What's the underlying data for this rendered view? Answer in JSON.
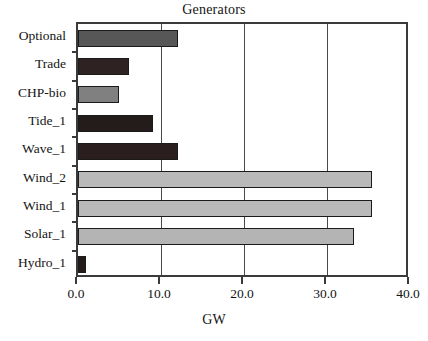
{
  "chart_data": {
    "type": "bar",
    "orientation": "horizontal",
    "title": "Generators",
    "xlabel": "GW",
    "ylabel": "",
    "xlim": [
      0.0,
      40.0
    ],
    "xticks": [
      "0.0",
      "10.0",
      "20.0",
      "30.0",
      "40.0"
    ],
    "xtick_values": [
      0.0,
      10.0,
      20.0,
      30.0,
      40.0
    ],
    "grid": "vertical gridlines at each x tick",
    "legend": "none",
    "categories": [
      "Optional",
      "Trade",
      "CHP-bio",
      "Tide_1",
      "Wave_1",
      "Wind_2",
      "Wind_1",
      "Solar_1",
      "Hydro_1"
    ],
    "values": [
      12.0,
      6.2,
      4.9,
      9.0,
      12.0,
      35.4,
      35.4,
      33.3,
      1.0
    ],
    "bars": [
      {
        "label": "Optional",
        "value": 12.0,
        "color": "#575757"
      },
      {
        "label": "Trade",
        "value": 6.2,
        "color": "#2e2322"
      },
      {
        "label": "CHP-bio",
        "value": 4.9,
        "color": "#808080"
      },
      {
        "label": "Tide_1",
        "value": 9.0,
        "color": "#241c1b"
      },
      {
        "label": "Wave_1",
        "value": 12.0,
        "color": "#2a1f1e"
      },
      {
        "label": "Wind_2",
        "value": 35.4,
        "color": "#b9b9b9"
      },
      {
        "label": "Wind_1",
        "value": 35.4,
        "color": "#b9b9b9"
      },
      {
        "label": "Solar_1",
        "value": 33.3,
        "color": "#b4b4b4"
      },
      {
        "label": "Hydro_1",
        "value": 1.0,
        "color": "#241c1b"
      }
    ],
    "colors": {
      "bar_outline": "#1b1b1b",
      "axis": "#3a3a3a",
      "gridline": "#4a4a4a",
      "text": "#141414",
      "background": "#ffffff"
    }
  }
}
